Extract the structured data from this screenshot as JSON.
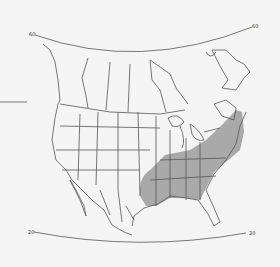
{
  "map": {
    "title": "",
    "type": "species range map",
    "region": "North America",
    "latitude_labels": {
      "top_left": "60",
      "top_right": "60",
      "bottom_left": "20",
      "bottom_right": "20"
    },
    "colors": {
      "background": "#f4f4f4",
      "borders": "#555555",
      "range_fill": "#a9a9a9"
    },
    "range": {
      "description": "Shaded distribution in eastern United States: east Texas and Oklahoma east through the Southeast, north to Missouri, Illinois, Indiana, Ohio, Pennsylvania and southern New York"
    }
  }
}
